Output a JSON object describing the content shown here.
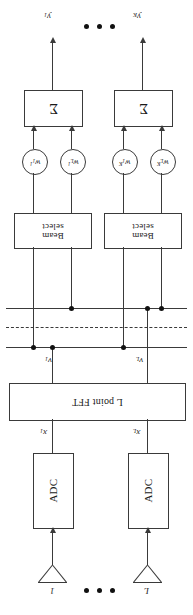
{
  "figure": {
    "orientation": "rotated-180"
  },
  "outputs": [
    {
      "name": "output-y1",
      "label_html": "y<sub>1</sub>"
    },
    {
      "name": "output-yK",
      "label_html": "y<sub>K</sub>"
    }
  ],
  "sum_blocks": [
    {
      "name": "sum-block-1",
      "label": "Σ"
    },
    {
      "name": "sum-block-K",
      "label": "Σ"
    }
  ],
  "weights": [
    {
      "name": "weight-w1-1",
      "label_html": "w<sub>1</sub><sup>1</sup>"
    },
    {
      "name": "weight-wL-1",
      "label_html": "w<sub>L</sub><sup>1</sup>"
    },
    {
      "name": "weight-w1-K",
      "label_html": "w<sub>1</sub><sup>K</sup>"
    },
    {
      "name": "weight-wL-K",
      "label_html": "w<sub>L</sub><sup>K</sup>"
    }
  ],
  "beam_select_blocks": [
    {
      "name": "beam-select-1",
      "line1": "Beam",
      "line2": "select"
    },
    {
      "name": "beam-select-K",
      "line1": "Beam",
      "line2": "select"
    }
  ],
  "fft_block": {
    "name": "l-point-fft",
    "label": "L point FFT"
  },
  "fft_outputs": [
    {
      "name": "signal-v1",
      "label_html": "v<sub>1</sub>"
    },
    {
      "name": "signal-vL",
      "label_html": "v<sub>L</sub>"
    }
  ],
  "adc_blocks": [
    {
      "name": "adc-1",
      "label": "ADC"
    },
    {
      "name": "adc-L",
      "label": "ADC"
    }
  ],
  "adc_outputs": [
    {
      "name": "signal-x1",
      "label_html": "x<sub>1</sub>"
    },
    {
      "name": "signal-xL",
      "label_html": "x<sub>L</sub>"
    }
  ],
  "antennas": [
    {
      "name": "antenna-1",
      "label": "1"
    },
    {
      "name": "antenna-L",
      "label": "L"
    }
  ],
  "ellipses": [
    {
      "name": "ellipsis-outputs",
      "dots": 3
    },
    {
      "name": "ellipsis-antennas",
      "dots": 3
    }
  ],
  "colors": {
    "stroke": "#3a3a3a",
    "node": "#111111",
    "background": "#ffffff",
    "text": "#1a1a1a"
  }
}
